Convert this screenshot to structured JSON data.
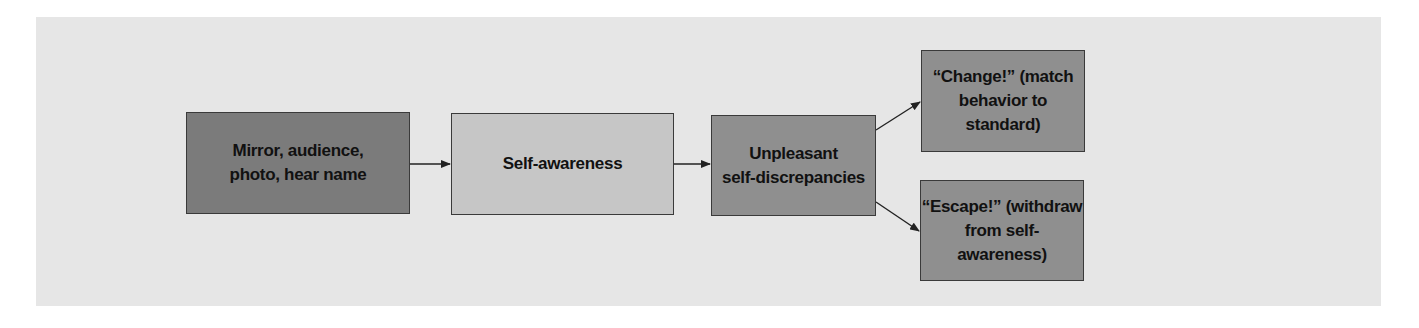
{
  "diagram": {
    "type": "flowchart",
    "colors": {
      "background_panel": "#e6e6e6",
      "page": "#ffffff",
      "border": "#3a3a3a",
      "arrow": "#222222"
    },
    "nodes": [
      {
        "id": "triggers",
        "lines": [
          "Mirror, audience,",
          "photo, hear name"
        ],
        "fill": "#7b7b7b"
      },
      {
        "id": "self_awareness",
        "lines": [
          "Self-awareness"
        ],
        "fill": "#c6c6c6"
      },
      {
        "id": "discrepancies",
        "lines": [
          "Unpleasant",
          "self-discrepancies"
        ],
        "fill": "#8f8f8f"
      },
      {
        "id": "change",
        "lines": [
          "“Change!” (match",
          "behavior to standard)"
        ],
        "fill": "#8f8f8f"
      },
      {
        "id": "escape",
        "lines": [
          "“Escape!” (withdraw",
          "from self-awareness)"
        ],
        "fill": "#8f8f8f"
      }
    ],
    "edges": [
      {
        "from": "triggers",
        "to": "self_awareness"
      },
      {
        "from": "self_awareness",
        "to": "discrepancies"
      },
      {
        "from": "discrepancies",
        "to": "change"
      },
      {
        "from": "discrepancies",
        "to": "escape"
      }
    ]
  }
}
